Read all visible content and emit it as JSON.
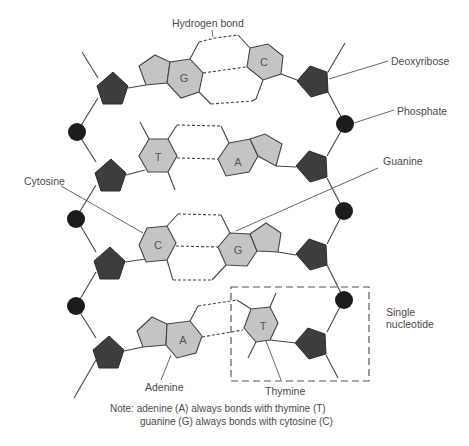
{
  "diagram": {
    "labels": {
      "hydrogen_bond": "Hydrogen bond",
      "deoxyribose": "Deoxyribose",
      "phosphate": "Phosphate",
      "guanine": "Guanine",
      "cytosine": "Cytosine",
      "adenine": "Adenine",
      "thymine": "Thymine",
      "single_nucleotide_line1": "Single",
      "single_nucleotide_line2": "nucleotide"
    },
    "base_pairs": [
      {
        "left": "G",
        "right": "C"
      },
      {
        "left": "T",
        "right": "A"
      },
      {
        "left": "C",
        "right": "G"
      },
      {
        "left": "A",
        "right": "T"
      }
    ],
    "note": {
      "line1": "Note: adenine (A) always bonds with thymine (T)",
      "line2": "guanine (G) always bonds with cytosine (C)"
    },
    "colors": {
      "sugar": "#3d3d3d",
      "phosphate": "#1c1c1c",
      "base": "#c4c4c4",
      "line": "#444444"
    }
  }
}
